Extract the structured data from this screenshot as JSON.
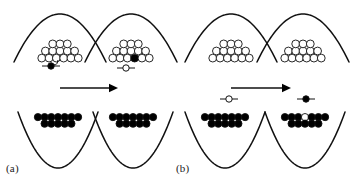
{
  "figure": {
    "width": 351,
    "height": 185,
    "background": "#ffffff",
    "stroke_color": "#111111",
    "fill_color": "#000000",
    "open_fill": "#ffffff"
  },
  "panel_labels": {
    "a": "(a)",
    "b": "(b)"
  },
  "groups": [
    {
      "id": "group-a",
      "label": "(a)",
      "arrow": {
        "name": "transition-arrow-a",
        "x1": 60,
        "y1": 88,
        "x2": 118,
        "y2": 88
      },
      "panels": [
        {
          "id": "a-top-left",
          "well": "upward",
          "cx": 60,
          "cy": 14,
          "halfwidth": 46,
          "depth": 48,
          "cluster": {
            "rows": [
              6,
              5,
              3
            ],
            "radius": 3.9,
            "filled": false,
            "extra_filled": null
          },
          "marker": {
            "type": "filled",
            "x": 51,
            "y": 66,
            "radius": 3.2,
            "bar": 9,
            "leader": true
          }
        },
        {
          "id": "a-top-right",
          "well": "upward",
          "cx": 131,
          "cy": 14,
          "halfwidth": 46,
          "depth": 48,
          "cluster": {
            "rows": [
              6,
              5,
              3
            ],
            "radius": 3.9,
            "filled": false,
            "extra_filled": "center"
          },
          "marker": {
            "type": "open",
            "x": 126,
            "y": 68,
            "radius": 3.2,
            "bar": 9,
            "leader": false
          }
        },
        {
          "id": "a-bottom-left",
          "well": "downward",
          "cx": 58,
          "cy": 168,
          "halfwidth": 40,
          "depth": 56,
          "cluster": {
            "rows": [
              7,
              5
            ],
            "radius": 3.6,
            "filled": true,
            "extra_filled": null
          },
          "marker": null
        },
        {
          "id": "a-bottom-right",
          "well": "downward",
          "cx": 133,
          "cy": 168,
          "halfwidth": 40,
          "depth": 56,
          "cluster": {
            "rows": [
              7,
              5
            ],
            "radius": 3.6,
            "filled": true,
            "extra_filled": null
          },
          "marker": null
        }
      ]
    },
    {
      "id": "group-b",
      "label": "(b)",
      "arrow": {
        "name": "transition-arrow-b",
        "x1": 231,
        "y1": 88,
        "x2": 291,
        "y2": 88
      },
      "panels": [
        {
          "id": "b-top-left",
          "well": "upward",
          "cx": 231,
          "cy": 14,
          "halfwidth": 46,
          "depth": 48,
          "cluster": {
            "rows": [
              6,
              5,
              3
            ],
            "radius": 3.9,
            "filled": false,
            "extra_filled": null
          },
          "marker": null
        },
        {
          "id": "b-top-right",
          "well": "upward",
          "cx": 303,
          "cy": 14,
          "halfwidth": 46,
          "depth": 48,
          "cluster": {
            "rows": [
              6,
              5,
              3
            ],
            "radius": 3.9,
            "filled": false,
            "extra_filled": null
          },
          "marker": null
        },
        {
          "id": "b-bottom-left",
          "well": "downward",
          "cx": 225,
          "cy": 168,
          "halfwidth": 40,
          "depth": 56,
          "cluster": {
            "rows": [
              7,
              5
            ],
            "radius": 3.6,
            "filled": true,
            "extra_filled": null
          },
          "marker": {
            "type": "open",
            "x": 229,
            "y": 99,
            "radius": 3.2,
            "bar": 9,
            "leader": false
          }
        },
        {
          "id": "b-bottom-right",
          "well": "downward",
          "cx": 305,
          "cy": 168,
          "halfwidth": 40,
          "depth": 56,
          "cluster": {
            "rows": [
              7,
              5
            ],
            "radius": 3.6,
            "filled": true,
            "extra_filled": "open-center"
          },
          "marker": {
            "type": "filled",
            "x": 306,
            "y": 99,
            "radius": 3.2,
            "bar": 9,
            "leader": false
          }
        }
      ]
    }
  ]
}
